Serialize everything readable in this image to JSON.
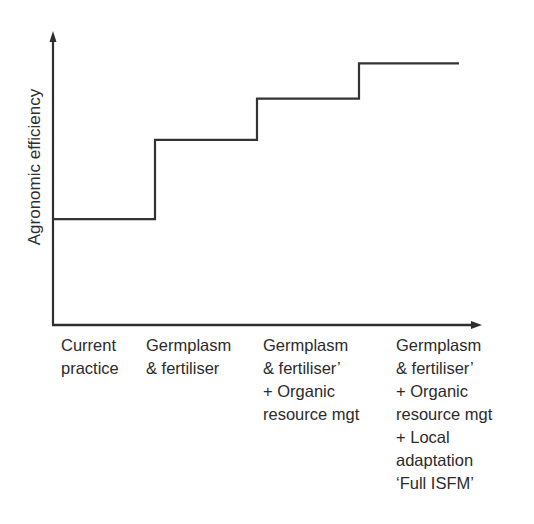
{
  "chart_data": {
    "type": "line",
    "subtype": "step",
    "title": "",
    "xlabel": "",
    "ylabel": "Agronomic efficiency",
    "categories": [
      "Current practice",
      "Germplasm & fertiliser",
      "Germplasm & fertiliser' + Organic resource mgt",
      "Germplasm & fertiliser' + Organic resource mgt + Local adaptation 'Full ISFM'"
    ],
    "category_lines": [
      [
        "Current",
        "practice"
      ],
      [
        "Germplasm",
        "& fertiliser"
      ],
      [
        "Germplasm",
        "& fertiliser’",
        "+ Organic",
        "resource mgt"
      ],
      [
        "Germplasm",
        "& fertiliser’",
        "+ Organic",
        "resource mgt",
        "+ Local",
        "adaptation",
        "‘Full ISFM’"
      ]
    ],
    "series": [
      {
        "name": "Agronomic efficiency",
        "values": [
          0.36,
          0.63,
          0.77,
          0.89
        ]
      }
    ],
    "ylim": [
      0,
      1
    ],
    "axis_ticks": false,
    "grid": false,
    "legend": "none",
    "line_color": "#333333"
  },
  "axes": {
    "y_label": "Agronomic efficiency"
  },
  "labels": {
    "col1": "Current\npractice",
    "col2": "Germplasm\n& fertiliser",
    "col3": "Germplasm\n& fertiliser’\n+ Organic\nresource mgt",
    "col4": "Germplasm\n& fertiliser’\n+ Organic\nresource mgt\n+ Local\nadaptation\n‘Full ISFM’"
  }
}
